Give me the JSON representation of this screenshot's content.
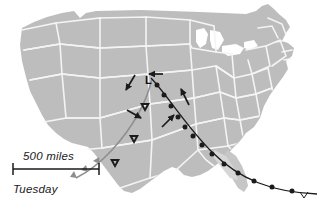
{
  "figure": {
    "kind": "weather-map",
    "region": "contiguous united states",
    "background_color": "#ffffff",
    "land_fill": "#bdbdbd",
    "land_fill_light": "#d2d2d2",
    "state_border_color": "#f2f2f2",
    "ink_color": "#1b1b1b",
    "dryline_color": "#8e8e8e"
  },
  "annotations": {
    "low_pressure_label": "L",
    "scale_bar": {
      "label": "500 miles",
      "length_px": 86
    },
    "day_label": "Tuesday"
  },
  "fronts": [
    {
      "name": "dry-line-front",
      "style": "barbed",
      "color": "#8e8e8e",
      "symbol": "triangle-barb",
      "path": "M 152 79 C 146 104, 132 128, 112 150 C 100 163, 88 172, 76 178",
      "barbs": [
        {
          "t": 0.82,
          "side": "right"
        },
        {
          "t": 0.93,
          "side": "right"
        },
        {
          "t": 1.0,
          "side": "right"
        }
      ]
    },
    {
      "name": "warm-front",
      "style": "semicircle",
      "color": "#1b1b1b",
      "symbol": "half-disc",
      "path": "M 151 78 C 168 96, 186 126, 212 152 C 240 180, 272 192, 317 194",
      "bumps": 12
    }
  ],
  "wind_arrows": [
    {
      "name": "arrow-north-plains",
      "x1": 135,
      "y1": 75,
      "x2": 126,
      "y2": 90,
      "dir": "south-southwest"
    },
    {
      "name": "arrow-low-center",
      "x1": 163,
      "y1": 74,
      "x2": 148,
      "y2": 74,
      "dir": "west"
    },
    {
      "name": "arrow-central-plains",
      "x1": 127,
      "y1": 110,
      "x2": 142,
      "y2": 118,
      "dir": "east-southeast"
    },
    {
      "name": "arrow-ozarks",
      "x1": 162,
      "y1": 127,
      "x2": 175,
      "y2": 114,
      "dir": "northeast"
    },
    {
      "name": "arrow-ohio-valley",
      "x1": 189,
      "y1": 105,
      "x2": 180,
      "y2": 88,
      "dir": "north-northeast"
    }
  ],
  "storm_markers": [
    {
      "name": "storm-marker-kansas",
      "x": 145,
      "y": 107
    },
    {
      "name": "storm-marker-panhandle",
      "x": 134,
      "y": 139
    },
    {
      "name": "storm-marker-west-texas",
      "x": 115,
      "y": 163
    }
  ]
}
